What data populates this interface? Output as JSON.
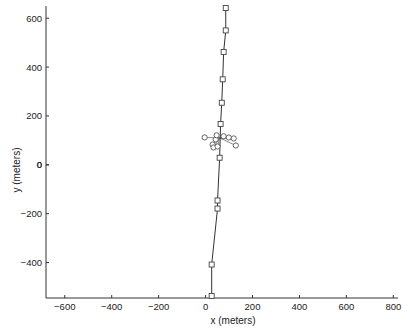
{
  "chart_data": {
    "type": "line",
    "title": "",
    "xlabel": "x (meters)",
    "ylabel": "y (meters)",
    "xlim": [
      -680,
      820
    ],
    "ylim": [
      -545,
      650
    ],
    "xticks": [
      -600,
      -400,
      -200,
      0,
      200,
      400,
      600,
      800
    ],
    "yticks": [
      -400,
      -200,
      0,
      200,
      400,
      600
    ],
    "grid": false,
    "legend": null,
    "series": [
      {
        "name": "trajectory",
        "marker": "square",
        "x": [
          86,
          86,
          77,
          73,
          69,
          64,
          60,
          51,
          51,
          26,
          26
        ],
        "y": [
          642,
          550,
          462,
          350,
          254,
          167,
          29,
          -146,
          -179,
          -408,
          -537
        ]
      },
      {
        "name": "cluster",
        "marker": "circle",
        "x": [
          -4,
          30,
          34,
          43,
          47,
          77,
          99,
          120,
          129,
          51
        ],
        "y": [
          112,
          83,
          71,
          104,
          121,
          117,
          112,
          108,
          79,
          75
        ]
      }
    ]
  },
  "axes": {
    "x_label": "x (meters)",
    "y_label": "y (meters)"
  }
}
